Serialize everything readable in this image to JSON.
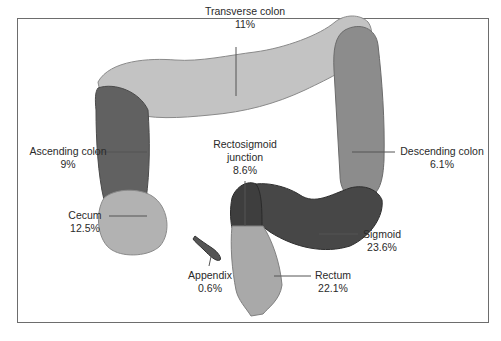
{
  "diagram": {
    "title": "",
    "segments": [
      {
        "id": "transverse",
        "name": "Transverse colon",
        "pct": "11%",
        "color": "#c3c3c3"
      },
      {
        "id": "ascending",
        "name": "Ascending colon",
        "pct": "9%",
        "color": "#616161"
      },
      {
        "id": "descending",
        "name": "Descending colon",
        "pct": "6.1%",
        "color": "#8c8c8c"
      },
      {
        "id": "rectosigmoid",
        "name": "Rectosigmoid junction",
        "name_line1": "Rectosigmoid",
        "name_line2": "junction",
        "pct": "8.6%",
        "color": "#3e3e3e"
      },
      {
        "id": "cecum",
        "name": "Cecum",
        "pct": "12.5%",
        "color": "#b2b2b2"
      },
      {
        "id": "sigmoid",
        "name": "Sigmoid",
        "pct": "23.6%",
        "color": "#474747"
      },
      {
        "id": "appendix",
        "name": "Appendix",
        "pct": "0.6%",
        "color": "#555555"
      },
      {
        "id": "rectum",
        "name": "Rectum",
        "pct": "22.1%",
        "color": "#a9a9a9"
      }
    ]
  }
}
